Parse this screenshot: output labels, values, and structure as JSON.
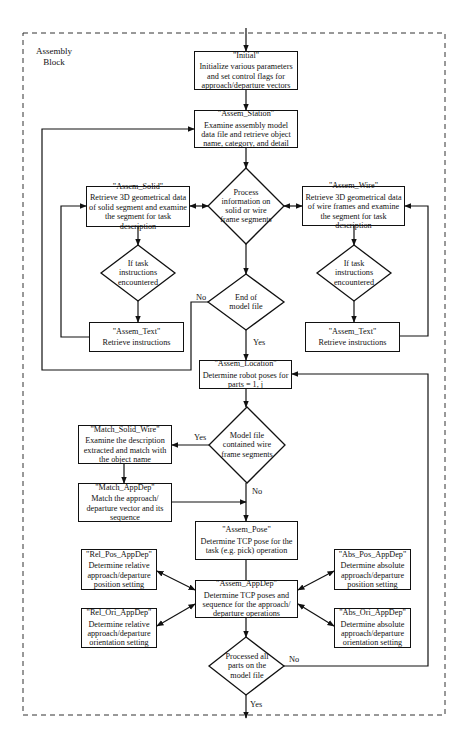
{
  "block": {
    "label_line1": "Assembly",
    "label_line2": "Block"
  },
  "nodes": {
    "initial": {
      "title": "\"Initial\"",
      "desc": "Initialize various parameters and set control flags for approach/departure vectors"
    },
    "assem_station": {
      "title": "\"Assem_Station\"",
      "desc": "Examine assembly model data file and retrieve object name, category, and detail"
    },
    "process_decision": {
      "text": "Process information on solid or wire frame segments"
    },
    "assem_solid": {
      "title": "\"Assem_Solid\"",
      "desc": "Retrieve 3D geometrical data of solid segment and examine the segment for task description"
    },
    "assem_wire": {
      "title": "\"Assem_Wire\"",
      "desc": "Retrieve 3D geometrical data of wire frames and examine the segment for task description"
    },
    "task_decision_left": {
      "text": "If task instructions encountered"
    },
    "task_decision_right": {
      "text": "If task instructions encountered"
    },
    "assem_text_left": {
      "title": "\"Assem_Text\"",
      "desc": "Retrieve instructions"
    },
    "assem_text_right": {
      "title": "\"Assem_Text\"",
      "desc": "Retrieve instructions"
    },
    "end_decision": {
      "text": "End of model file"
    },
    "assem_location": {
      "title": "\"Assem_Location\"",
      "desc": "Determine robot poses for parts = 1, j"
    },
    "model_decision": {
      "text": "Model file contained wire frame segments"
    },
    "match_solid_wire": {
      "title": "\"Match_Solid_Wire\"",
      "desc": "Examine the description extracted and match with the object name"
    },
    "match_appdep": {
      "title": "\"Match_AppDep\"",
      "desc": "Match the approach/ departure vector and its sequence"
    },
    "assem_pose": {
      "title": "\"Assem_Pose\"",
      "desc": "Determine TCP pose for the task (e.g. pick) operation"
    },
    "assem_appdep": {
      "title": "\"Assem_AppDep\"",
      "desc": "Determine TCP poses and sequence for the approach/ departure operations"
    },
    "rel_pos_appdep": {
      "title": "\"Rel_Pos_AppDep\"",
      "desc": "Determine relative approach/departure position setting"
    },
    "rel_ori_appdep": {
      "title": "\"Rel_Ori_AppDep\"",
      "desc": "Determine relative approach/departure orientation setting"
    },
    "abs_pos_appdep": {
      "title": "\"Abs_Pos_AppDep\"",
      "desc": "Determine absolute approach/departure position setting"
    },
    "abs_ori_appdep": {
      "title": "\"Abs_Ori_AppDep\"",
      "desc": "Determine absolute approach/departure orientation setting"
    },
    "processed_decision": {
      "text": "Processed all parts on the model file"
    }
  },
  "edge_labels": {
    "end_no": "No",
    "end_yes": "Yes",
    "model_yes": "Yes",
    "model_no": "No",
    "processed_no": "No",
    "processed_yes": "Yes"
  },
  "colors": {
    "stroke": "#111111",
    "background": "#ffffff",
    "dashed_border": "#333333"
  }
}
